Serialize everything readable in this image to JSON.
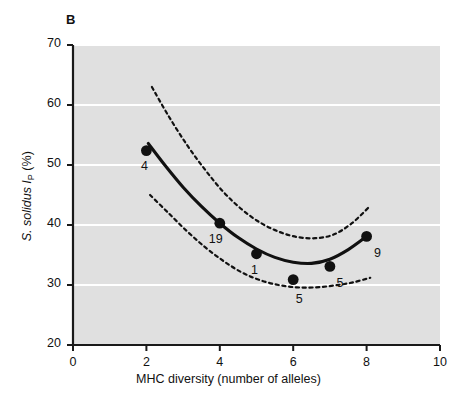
{
  "panel": {
    "letter": "B"
  },
  "chart_data": {
    "type": "scatter",
    "title": "",
    "panel_label": "B",
    "xlabel": "MHC diversity (number of alleles)",
    "ylabel": "S. solidus IP (%)",
    "ylabel_parts": {
      "species": "S. solidus",
      "symbol": "I",
      "subscript": "P",
      "unit": "(%)"
    },
    "xlim": [
      0,
      10
    ],
    "ylim": [
      20,
      70
    ],
    "xticks": [
      "0",
      "2",
      "4",
      "6",
      "8",
      "10"
    ],
    "yticks": [
      "20",
      "30",
      "40",
      "50",
      "60",
      "70"
    ],
    "xtick_values": [
      0,
      2,
      4,
      6,
      8,
      10
    ],
    "ytick_values": [
      20,
      30,
      40,
      50,
      60,
      70
    ],
    "grid": "horizontal-white",
    "legend": "none",
    "plot_background": "#e0e0e0",
    "marker_color": "#111111",
    "fit_line_color": "#111111",
    "ci_line_style": "dotted",
    "x": [
      2,
      4,
      5,
      6,
      7,
      8
    ],
    "y": [
      52.4,
      40.3,
      35.2,
      30.9,
      33.1,
      38.1
    ],
    "point_labels": [
      "4",
      "19",
      "1",
      "5",
      "5",
      "9"
    ],
    "points": [
      {
        "x": 2,
        "y": 52.4,
        "label": "4"
      },
      {
        "x": 4,
        "y": 40.3,
        "label": "19"
      },
      {
        "x": 5,
        "y": 35.2,
        "label": "1"
      },
      {
        "x": 6,
        "y": 30.9,
        "label": "5"
      },
      {
        "x": 7,
        "y": 33.1,
        "label": "5"
      },
      {
        "x": 8,
        "y": 38.1,
        "label": "9"
      }
    ],
    "fit_curve": {
      "name": "quadratic fit",
      "style": "solid",
      "x": [
        2.05,
        2.5,
        3.0,
        3.5,
        4.0,
        4.5,
        5.0,
        5.5,
        6.0,
        6.5,
        7.0,
        7.5,
        8.0
      ],
      "y": [
        53.6,
        50.0,
        46.3,
        43.1,
        40.3,
        37.9,
        36.0,
        34.6,
        33.8,
        33.6,
        34.3,
        35.9,
        38.1
      ]
    },
    "ci_upper": {
      "name": "upper confidence band",
      "style": "dotted",
      "x": [
        2.15,
        2.6,
        3.1,
        3.6,
        4.1,
        4.6,
        5.1,
        5.6,
        6.1,
        6.6,
        7.1,
        7.6,
        8.1
      ],
      "y": [
        63.0,
        58.2,
        53.4,
        49.2,
        45.5,
        42.6,
        40.4,
        38.9,
        38.0,
        37.8,
        38.4,
        40.3,
        43.2
      ]
    },
    "ci_lower": {
      "name": "lower confidence band",
      "style": "dotted",
      "x": [
        2.1,
        2.6,
        3.1,
        3.6,
        4.1,
        4.6,
        5.1,
        5.6,
        6.1,
        6.6,
        7.1,
        7.6,
        8.1
      ],
      "y": [
        45.0,
        42.0,
        39.0,
        36.3,
        34.0,
        32.1,
        30.8,
        30.0,
        29.6,
        29.6,
        29.9,
        30.4,
        31.2
      ]
    }
  }
}
